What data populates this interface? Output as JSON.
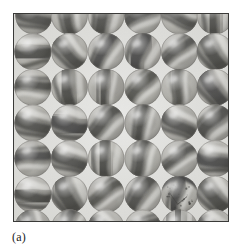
{
  "figure": {
    "caption": "(a)",
    "kind": "photograph",
    "frame": {
      "x": 13,
      "y": 13,
      "width": 216,
      "height": 209,
      "border_color": "#3a3a38",
      "border_width": 1
    },
    "palette": {
      "page_background": "#ffffff",
      "photo_background": "#e7e7e4",
      "gap_light": "#ececeb",
      "marble_base_light": "#d3d2cd",
      "marble_base_mid": "#a9a8a2",
      "marble_shadow": "#6f6e69",
      "swirl_dark": "#2b2b29",
      "swirl_mid": "#5a5a55",
      "highlight": "#f4f4f1",
      "caption_color": "#1c1c1c"
    },
    "grid": {
      "columns": 6,
      "visible_full_rows": 5,
      "partial_row_top": true,
      "partial_row_bottom": true,
      "marble_diameter": 37,
      "column_pitch": 36.5,
      "row_pitch": 36.5,
      "row_offset_x": 2
    },
    "marbles": [
      {
        "row": 0,
        "col": 0,
        "cx": 20,
        "cy": 2,
        "r": 18.5,
        "tone": 0.55,
        "swirl_angle": 25,
        "swirl_width": 0.4,
        "swirl_dark": 0.62,
        "clipped": "top"
      },
      {
        "row": 0,
        "col": 1,
        "cx": 56,
        "cy": 2,
        "r": 18.5,
        "tone": 0.5,
        "swirl_angle": 70,
        "swirl_width": 0.34,
        "swirl_dark": 0.7,
        "clipped": "top"
      },
      {
        "row": 0,
        "col": 2,
        "cx": 93,
        "cy": 2,
        "r": 18.5,
        "tone": 0.46,
        "swirl_angle": 110,
        "swirl_width": 0.44,
        "swirl_dark": 0.74,
        "clipped": "top"
      },
      {
        "row": 0,
        "col": 3,
        "cx": 130,
        "cy": 2,
        "r": 18.5,
        "tone": 0.52,
        "swirl_angle": 150,
        "swirl_width": 0.38,
        "swirl_dark": 0.66,
        "clipped": "top"
      },
      {
        "row": 0,
        "col": 4,
        "cx": 167,
        "cy": 2,
        "r": 18.5,
        "tone": 0.6,
        "swirl_angle": 15,
        "swirl_width": 0.3,
        "swirl_dark": 0.55,
        "clipped": "top"
      },
      {
        "row": 0,
        "col": 5,
        "cx": 203,
        "cy": 2,
        "r": 18.5,
        "tone": 0.48,
        "swirl_angle": 95,
        "swirl_width": 0.42,
        "swirl_dark": 0.72,
        "clipped": "top"
      },
      {
        "row": 1,
        "col": 0,
        "cx": 19,
        "cy": 38,
        "r": 18.5,
        "tone": 0.62,
        "swirl_angle": 8,
        "swirl_width": 0.46,
        "swirl_dark": 0.8
      },
      {
        "row": 1,
        "col": 1,
        "cx": 56,
        "cy": 38,
        "r": 18.5,
        "tone": 0.6,
        "swirl_angle": 35,
        "swirl_width": 0.4,
        "swirl_dark": 0.72
      },
      {
        "row": 1,
        "col": 2,
        "cx": 93,
        "cy": 38,
        "r": 18.5,
        "tone": 0.56,
        "swirl_angle": 120,
        "swirl_width": 0.36,
        "swirl_dark": 0.76
      },
      {
        "row": 1,
        "col": 3,
        "cx": 130,
        "cy": 38,
        "r": 18.5,
        "tone": 0.5,
        "swirl_angle": 100,
        "swirl_width": 0.48,
        "swirl_dark": 0.84
      },
      {
        "row": 1,
        "col": 4,
        "cx": 167,
        "cy": 38,
        "r": 18.5,
        "tone": 0.66,
        "swirl_angle": 140,
        "swirl_width": 0.32,
        "swirl_dark": 0.62
      },
      {
        "row": 1,
        "col": 5,
        "cx": 203,
        "cy": 38,
        "r": 18.5,
        "tone": 0.44,
        "swirl_angle": 55,
        "swirl_width": 0.5,
        "swirl_dark": 0.88
      },
      {
        "row": 2,
        "col": 0,
        "cx": 19,
        "cy": 74,
        "r": 18.5,
        "tone": 0.58,
        "swirl_angle": 170,
        "swirl_width": 0.34,
        "swirl_dark": 0.7
      },
      {
        "row": 2,
        "col": 1,
        "cx": 56,
        "cy": 74,
        "r": 18.5,
        "tone": 0.48,
        "swirl_angle": 80,
        "swirl_width": 0.46,
        "swirl_dark": 0.86
      },
      {
        "row": 2,
        "col": 2,
        "cx": 93,
        "cy": 74,
        "r": 18.5,
        "tone": 0.62,
        "swirl_angle": 95,
        "swirl_width": 0.3,
        "swirl_dark": 0.72
      },
      {
        "row": 2,
        "col": 3,
        "cx": 130,
        "cy": 74,
        "r": 18.5,
        "tone": 0.58,
        "swirl_angle": 130,
        "swirl_width": 0.36,
        "swirl_dark": 0.64
      },
      {
        "row": 2,
        "col": 4,
        "cx": 167,
        "cy": 74,
        "r": 18.5,
        "tone": 0.64,
        "swirl_angle": 100,
        "swirl_width": 0.28,
        "swirl_dark": 0.58
      },
      {
        "row": 2,
        "col": 5,
        "cx": 203,
        "cy": 74,
        "r": 18.5,
        "tone": 0.46,
        "swirl_angle": 60,
        "swirl_width": 0.48,
        "swirl_dark": 0.84
      },
      {
        "row": 3,
        "col": 0,
        "cx": 19,
        "cy": 110,
        "r": 18.5,
        "tone": 0.6,
        "swirl_angle": 20,
        "swirl_width": 0.42,
        "swirl_dark": 0.74
      },
      {
        "row": 3,
        "col": 1,
        "cx": 56,
        "cy": 110,
        "r": 18.5,
        "tone": 0.52,
        "swirl_angle": 10,
        "swirl_width": 0.5,
        "swirl_dark": 0.82
      },
      {
        "row": 3,
        "col": 2,
        "cx": 93,
        "cy": 110,
        "r": 18.5,
        "tone": 0.56,
        "swirl_angle": 145,
        "swirl_width": 0.38,
        "swirl_dark": 0.7
      },
      {
        "row": 3,
        "col": 3,
        "cx": 130,
        "cy": 110,
        "r": 18.5,
        "tone": 0.66,
        "swirl_angle": 105,
        "swirl_width": 0.3,
        "swirl_dark": 0.88
      },
      {
        "row": 3,
        "col": 4,
        "cx": 167,
        "cy": 110,
        "r": 18.5,
        "tone": 0.58,
        "swirl_angle": 40,
        "swirl_width": 0.4,
        "swirl_dark": 0.66
      },
      {
        "row": 3,
        "col": 5,
        "cx": 203,
        "cy": 110,
        "r": 18.5,
        "tone": 0.5,
        "swirl_angle": 125,
        "swirl_width": 0.44,
        "swirl_dark": 0.8
      },
      {
        "row": 4,
        "col": 0,
        "cx": 19,
        "cy": 146,
        "r": 18.5,
        "tone": 0.58,
        "swirl_angle": 165,
        "swirl_width": 0.36,
        "swirl_dark": 0.76
      },
      {
        "row": 4,
        "col": 1,
        "cx": 56,
        "cy": 146,
        "r": 18.5,
        "tone": 0.54,
        "swirl_angle": 30,
        "swirl_width": 0.4,
        "swirl_dark": 0.68
      },
      {
        "row": 4,
        "col": 2,
        "cx": 93,
        "cy": 146,
        "r": 18.5,
        "tone": 0.48,
        "swirl_angle": 85,
        "swirl_width": 0.46,
        "swirl_dark": 0.86
      },
      {
        "row": 4,
        "col": 3,
        "cx": 130,
        "cy": 146,
        "r": 18.5,
        "tone": 0.6,
        "swirl_angle": 115,
        "swirl_width": 0.34,
        "swirl_dark": 0.7
      },
      {
        "row": 4,
        "col": 4,
        "cx": 167,
        "cy": 146,
        "r": 18.5,
        "tone": 0.68,
        "swirl_angle": 150,
        "swirl_width": 0.28,
        "swirl_dark": 0.6
      },
      {
        "row": 4,
        "col": 5,
        "cx": 203,
        "cy": 146,
        "r": 18.5,
        "tone": 0.5,
        "swirl_angle": 20,
        "swirl_width": 0.44,
        "swirl_dark": 0.82
      },
      {
        "row": 5,
        "col": 0,
        "cx": 19,
        "cy": 182,
        "r": 18.5,
        "tone": 0.54,
        "swirl_angle": 5,
        "swirl_width": 0.44,
        "swirl_dark": 0.86
      },
      {
        "row": 5,
        "col": 1,
        "cx": 56,
        "cy": 182,
        "r": 18.5,
        "tone": 0.42,
        "swirl_angle": 70,
        "swirl_width": 0.56,
        "swirl_dark": 0.9
      },
      {
        "row": 5,
        "col": 2,
        "cx": 93,
        "cy": 182,
        "r": 18.5,
        "tone": 0.66,
        "swirl_angle": 150,
        "swirl_width": 0.3,
        "swirl_dark": 0.64
      },
      {
        "row": 5,
        "col": 3,
        "cx": 130,
        "cy": 182,
        "r": 18.5,
        "tone": 0.52,
        "swirl_angle": 125,
        "swirl_width": 0.42,
        "swirl_dark": 0.78
      },
      {
        "row": 5,
        "col": 4,
        "cx": 167,
        "cy": 182,
        "r": 18.5,
        "tone": 0.6,
        "swirl_angle": 95,
        "swirl_width": 0.34,
        "swirl_dark": 0.92,
        "defect": "cracked-dark-cap"
      },
      {
        "row": 5,
        "col": 5,
        "cx": 203,
        "cy": 182,
        "r": 18.5,
        "tone": 0.46,
        "swirl_angle": 45,
        "swirl_width": 0.48,
        "swirl_dark": 0.88
      },
      {
        "row": 6,
        "col": 0,
        "cx": 19,
        "cy": 216,
        "r": 18.5,
        "tone": 0.56,
        "swirl_angle": 60,
        "swirl_width": 0.36,
        "swirl_dark": 0.66,
        "clipped": "bottom"
      },
      {
        "row": 6,
        "col": 1,
        "cx": 56,
        "cy": 216,
        "r": 18.5,
        "tone": 0.58,
        "swirl_angle": 120,
        "swirl_width": 0.34,
        "swirl_dark": 0.62,
        "clipped": "bottom"
      },
      {
        "row": 6,
        "col": 2,
        "cx": 93,
        "cy": 216,
        "r": 18.5,
        "tone": 0.54,
        "swirl_angle": 20,
        "swirl_width": 0.38,
        "swirl_dark": 0.68,
        "clipped": "bottom"
      },
      {
        "row": 6,
        "col": 3,
        "cx": 130,
        "cy": 216,
        "r": 18.5,
        "tone": 0.6,
        "swirl_angle": 160,
        "swirl_width": 0.32,
        "swirl_dark": 0.6,
        "clipped": "bottom"
      },
      {
        "row": 6,
        "col": 4,
        "cx": 167,
        "cy": 216,
        "r": 18.5,
        "tone": 0.52,
        "swirl_angle": 90,
        "swirl_width": 0.4,
        "swirl_dark": 0.72,
        "clipped": "bottom"
      },
      {
        "row": 6,
        "col": 5,
        "cx": 203,
        "cy": 216,
        "r": 18.5,
        "tone": 0.5,
        "swirl_angle": 35,
        "swirl_width": 0.42,
        "swirl_dark": 0.7,
        "clipped": "bottom"
      }
    ]
  }
}
